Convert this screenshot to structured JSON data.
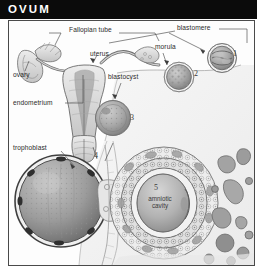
{
  "header": {
    "title": "OVUM",
    "background_color": "#0b0b0b",
    "text_color": "#ffffff"
  },
  "figure": {
    "style": "grayscale engraving / pencil medical illustration",
    "border_color": "#4a4a4a",
    "background_color": "#fdfdfd",
    "labels": [
      {
        "name": "fallopian-tube",
        "text": "Fallopian tube"
      },
      {
        "name": "blastomere",
        "text": "blastomere"
      },
      {
        "name": "morula",
        "text": "morula"
      },
      {
        "name": "uterus",
        "text": "uterus"
      },
      {
        "name": "ovary",
        "text": "ovary"
      },
      {
        "name": "blastocyst",
        "text": "blastocyst"
      },
      {
        "name": "endometrium",
        "text": "endometrium"
      },
      {
        "name": "trophoblast",
        "text": "trophoblast"
      },
      {
        "name": "amniotic-cavity",
        "text": "amniotic cavity"
      }
    ],
    "stage_numbers": [
      "1",
      "2",
      "3",
      "4",
      "5"
    ],
    "label_text": {
      "fallopian_tube": "Fallopian tube",
      "blastomere": "blastomere",
      "morula": "morula",
      "uterus": "uterus",
      "ovary": "ovary",
      "blastocyst": "blastocyst",
      "endometrium": "endometrium",
      "trophoblast": "trophoblast",
      "amniotic_cavity_line1": "amniotic",
      "amniotic_cavity_line2": "cavity"
    },
    "numbers": {
      "one": "1",
      "two": "2",
      "three": "3",
      "four": "4",
      "five": "5"
    }
  }
}
